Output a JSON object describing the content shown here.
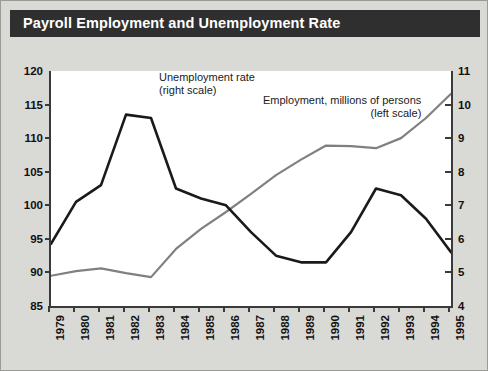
{
  "header": {
    "title": "Payroll Employment and Unemployment Rate"
  },
  "annotations": {
    "unemployment_line1": "Unemployment rate",
    "unemployment_line2": "(right scale)",
    "employment_line1": "Employment, millions of persons",
    "employment_line2": "(left scale)"
  },
  "colors": {
    "title_bar": "#2f2f2f",
    "figure_background": "#d9d9d6",
    "plot_background": "#ffffff",
    "axis": "#3a3a3a",
    "unemployment_line": "#1a1a1a",
    "employment_line": "#808080"
  },
  "chart_data": {
    "type": "line",
    "title": "Payroll Employment and Unemployment Rate",
    "xlabel": "",
    "ylabel": "",
    "grid": false,
    "legend": "annotations-inline",
    "x": [
      1979,
      1980,
      1981,
      1982,
      1983,
      1984,
      1985,
      1986,
      1987,
      1988,
      1989,
      1990,
      1991,
      1992,
      1993,
      1994,
      1995
    ],
    "xticklabels": [
      "1979",
      "1980",
      "1981",
      "1982",
      "1983",
      "1984",
      "1985",
      "1986",
      "1987",
      "1988",
      "1989",
      "1990",
      "1991",
      "1992",
      "1993",
      "1994",
      "1995"
    ],
    "left_axis": {
      "label": "Employment, millions of persons",
      "ylim": [
        85,
        120
      ],
      "yticks": [
        85,
        90,
        95,
        100,
        105,
        110,
        115,
        120
      ],
      "yticklabels": [
        "85",
        "90",
        "95",
        "100",
        "105",
        "110",
        "115",
        "120"
      ]
    },
    "right_axis": {
      "label": "Unemployment rate",
      "ylim": [
        4,
        11
      ],
      "yticks": [
        4,
        5,
        6,
        7,
        8,
        9,
        10,
        11
      ],
      "yticklabels": [
        "4",
        "5",
        "6",
        "7",
        "8",
        "9",
        "10",
        "11"
      ]
    },
    "series": [
      {
        "name": "Employment, millions of persons (left scale)",
        "axis": "left",
        "color": "#808080",
        "values": [
          89.5,
          90.2,
          90.6,
          89.9,
          89.3,
          93.5,
          96.5,
          99.0,
          101.7,
          104.5,
          106.8,
          108.9,
          108.8,
          108.5,
          110.0,
          113.0,
          116.6
        ]
      },
      {
        "name": "Unemployment rate (right scale)",
        "axis": "right",
        "color": "#1a1a1a",
        "values": [
          5.85,
          7.1,
          7.6,
          9.7,
          9.6,
          7.5,
          7.2,
          7.0,
          6.2,
          5.5,
          5.3,
          5.3,
          6.2,
          7.5,
          7.3,
          6.6,
          5.6
        ]
      }
    ]
  }
}
